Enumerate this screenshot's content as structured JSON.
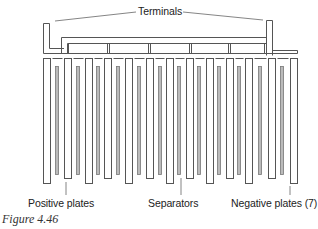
{
  "diagram": {
    "labels": {
      "terminals": "Terminals",
      "positive_plates": "Positive plates",
      "separators": "Separators",
      "negative_plates": "Negative plates (7)"
    },
    "caption": "Figure 4.46",
    "counts": {
      "negative_plates": 7,
      "positive_plates": 6,
      "separators": 12
    },
    "colors": {
      "line": "#555555",
      "separator": "#888888",
      "background": "#ffffff"
    }
  }
}
